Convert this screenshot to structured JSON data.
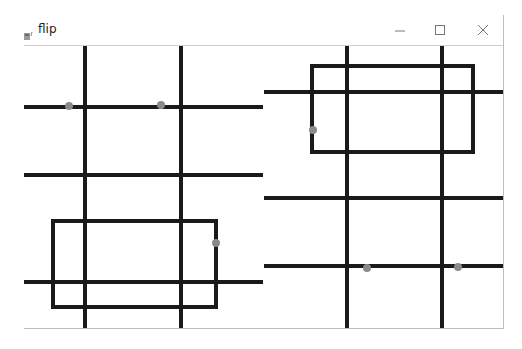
{
  "window": {
    "title": "flip",
    "icon": "app-icon",
    "controls": {
      "minimize": "minimize-icon",
      "maximize": "maximize-icon",
      "close": "close-icon"
    }
  },
  "colors": {
    "line": "#1a1a1a",
    "dot": "#8a8a8a",
    "background": "#ffffff"
  },
  "panels": [
    {
      "name": "left-panel",
      "vertical_lines_x": [
        85,
        181
      ],
      "horizontal_lines_y": [
        107,
        175,
        282
      ],
      "rectangle": {
        "x1": 53,
        "y1": 221,
        "x2": 216,
        "y2": 307
      },
      "dots": [
        [
          69,
          106
        ],
        [
          161,
          105
        ],
        [
          216,
          243
        ]
      ]
    },
    {
      "name": "right-panel",
      "vertical_lines_x": [
        347,
        442
      ],
      "horizontal_lines_y": [
        92,
        198,
        266
      ],
      "rectangle": {
        "x1": 312,
        "y1": 66,
        "x2": 473,
        "y2": 152
      },
      "dots": [
        [
          313,
          130
        ],
        [
          367,
          268
        ],
        [
          458,
          267
        ]
      ]
    }
  ]
}
